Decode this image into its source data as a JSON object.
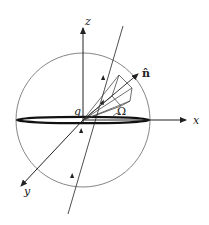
{
  "diagram": {
    "labels": {
      "z_axis": "z",
      "x_axis": "x",
      "y_axis": "y",
      "normal": "n̂",
      "origin_angle": "q",
      "solid_angle": "Ω"
    },
    "colors": {
      "stroke": "#222222",
      "sphere": "#555555",
      "background": "#ffffff"
    }
  }
}
